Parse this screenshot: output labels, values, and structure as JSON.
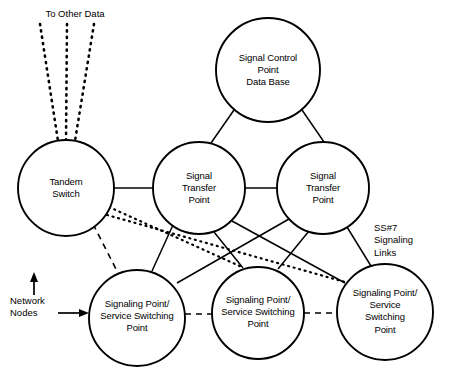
{
  "diagram": {
    "canvas": {
      "width": 451,
      "height": 373
    },
    "stroke_color": "#000000",
    "fill_color": "#ffffff",
    "nodes": [
      {
        "id": "scp",
        "label": "Signal Control\nPoint\nData Base",
        "cx": 268,
        "cy": 70,
        "r": 52
      },
      {
        "id": "tandem-switch",
        "label": "Tandem\nSwitch",
        "cx": 66,
        "cy": 188,
        "r": 48
      },
      {
        "id": "stp-left",
        "label": "Signal\nTransfer\nPoint",
        "cx": 199,
        "cy": 188,
        "r": 46
      },
      {
        "id": "stp-right",
        "label": "Signal\nTransfer\nPoint",
        "cx": 323,
        "cy": 188,
        "r": 46
      },
      {
        "id": "ssp-left",
        "label": "Signaling Point/\nService Switching\nPoint",
        "cx": 137,
        "cy": 318,
        "r": 48
      },
      {
        "id": "ssp-middle",
        "label": "Signaling Point/\nService Switching\nPoint",
        "cx": 258,
        "cy": 313,
        "r": 46
      },
      {
        "id": "ssp-right",
        "label": "Signaling Point/\nService Switching\nPoint",
        "cx": 385,
        "cy": 312,
        "r": 48
      }
    ],
    "annotations": [
      {
        "id": "to-other-data",
        "text": "To Other Data",
        "x": 75,
        "y": 8,
        "align": "center"
      },
      {
        "id": "ss7-signaling-links",
        "text": "SS#7\nSignaling\nLinks",
        "x": 374,
        "y": 222,
        "align": "left"
      },
      {
        "id": "network-nodes",
        "text": "Network\nNodes",
        "x": 10,
        "y": 295,
        "align": "left"
      }
    ],
    "legend": {
      "solid_line": "SS#7 signaling link",
      "dotted_line": "Trunk to signaling point",
      "dashed_line": "Interoffice trunk"
    }
  }
}
